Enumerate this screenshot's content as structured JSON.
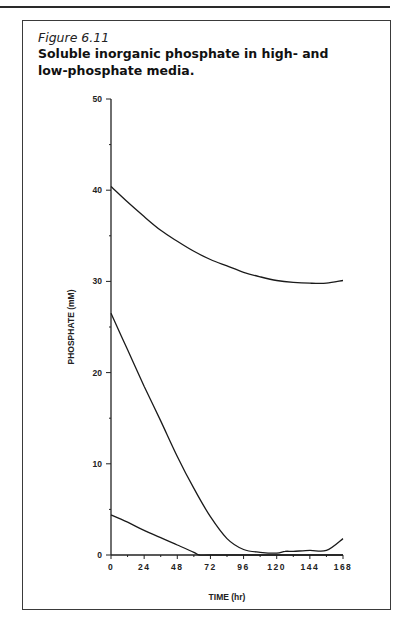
{
  "figure": {
    "label": "Figure 6.11",
    "title": "Soluble inorganic phosphate in high- and low-phosphate media."
  },
  "chart_data": {
    "type": "line",
    "title": "Soluble inorganic phosphate in high- and low-phosphate media.",
    "xlabel": "TIME (hr)",
    "ylabel": "PHOSPHATE (mM)",
    "xlim": [
      0,
      168
    ],
    "ylim": [
      0,
      50
    ],
    "x_ticks": [
      0,
      24,
      48,
      72,
      96,
      120,
      144,
      168
    ],
    "y_ticks": [
      0,
      10,
      20,
      30,
      40,
      50
    ],
    "grid": false,
    "legend": null,
    "series": [
      {
        "name": "high phosphate",
        "x": [
          0,
          12,
          24,
          36,
          48,
          60,
          72,
          84,
          96,
          108,
          120,
          132,
          144,
          156,
          168
        ],
        "y": [
          40.4,
          38.7,
          37.1,
          35.6,
          34.4,
          33.3,
          32.4,
          31.7,
          31.0,
          30.5,
          30.1,
          29.9,
          29.8,
          29.8,
          30.1
        ]
      },
      {
        "name": "intermediate phosphate",
        "x": [
          0,
          12,
          24,
          36,
          48,
          60,
          72,
          84,
          96,
          108,
          120,
          126,
          132,
          144,
          156,
          168
        ],
        "y": [
          26.5,
          22.5,
          18.5,
          14.7,
          10.8,
          7.3,
          4.2,
          1.8,
          0.6,
          0.3,
          0.2,
          0.4,
          0.4,
          0.5,
          0.5,
          1.8
        ]
      },
      {
        "name": "low phosphate",
        "x": [
          0,
          12,
          24,
          36,
          48,
          60,
          64,
          72,
          96,
          120,
          144,
          168
        ],
        "y": [
          4.4,
          3.6,
          2.7,
          1.9,
          1.1,
          0.3,
          0.0,
          0.0,
          0.0,
          0.0,
          0.0,
          0.0
        ]
      }
    ]
  },
  "styles": {
    "line_color": "#1a1a1a",
    "axis_color": "#222222"
  }
}
